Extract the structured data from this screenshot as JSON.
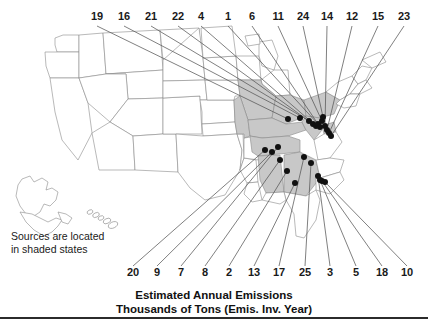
{
  "figure": {
    "title_line1": "Estimated Annual Emissions",
    "title_line2": "Thousands of Tons (Emis. Inv. Year)",
    "caption": "Sources are located\nin shaded states"
  },
  "colors": {
    "shaded_state": "#c8c8c8",
    "unshaded_state": "#ffffff",
    "state_border": "#8a8a8a",
    "leader_line": "#555555",
    "marker": "#111111",
    "text": "#1a1a1a",
    "rule": "#2b2b2b"
  },
  "map": {
    "type": "choropleth-point-callout",
    "region": "United States",
    "insets": [
      "Alaska",
      "Hawaii"
    ],
    "shaded_states": [
      "Illinois",
      "Missouri",
      "Kentucky",
      "Tennessee",
      "Alabama",
      "Georgia",
      "Ohio",
      "West Virginia",
      "Pennsylvania",
      "Maryland",
      "Indiana-partial"
    ],
    "legend_note": "Shaded states contain the emission sources"
  },
  "chart_data": {
    "type": "scatter",
    "title": "Estimated Annual Emissions",
    "subtitle": "Thousands of Tons (Emis. Inv. Year)",
    "xlabel": "",
    "ylabel": "",
    "grid": false,
    "legend": "none",
    "annotation": "Sources are located in shaded states",
    "top_labels": [
      "19",
      "16",
      "21",
      "22",
      "4",
      "1",
      "6",
      "11",
      "24",
      "14",
      "12",
      "15",
      "23"
    ],
    "bottom_labels": [
      "20",
      "9",
      "7",
      "8",
      "2",
      "13",
      "17",
      "25",
      "3",
      "5",
      "18",
      "10"
    ],
    "callouts": [
      {
        "id": "19",
        "side": "top",
        "label_x": 97,
        "label_y": 18,
        "point_x": 288,
        "point_y": 119
      },
      {
        "id": "16",
        "side": "top",
        "label_x": 124,
        "label_y": 18,
        "point_x": 300,
        "point_y": 118
      },
      {
        "id": "21",
        "side": "top",
        "label_x": 151,
        "label_y": 18,
        "point_x": 309,
        "point_y": 121
      },
      {
        "id": "22",
        "side": "top",
        "label_x": 178,
        "label_y": 18,
        "point_x": 313,
        "point_y": 124
      },
      {
        "id": "4",
        "side": "top",
        "label_x": 201,
        "label_y": 18,
        "point_x": 316,
        "point_y": 126
      },
      {
        "id": "1",
        "side": "top",
        "label_x": 228,
        "label_y": 18,
        "point_x": 318,
        "point_y": 124
      },
      {
        "id": "6",
        "side": "top",
        "label_x": 252,
        "label_y": 18,
        "point_x": 320,
        "point_y": 127
      },
      {
        "id": "11",
        "side": "top",
        "label_x": 278,
        "label_y": 18,
        "point_x": 322,
        "point_y": 121
      },
      {
        "id": "24",
        "side": "top",
        "label_x": 303,
        "label_y": 18,
        "point_x": 323,
        "point_y": 117
      },
      {
        "id": "14",
        "side": "top",
        "label_x": 327,
        "label_y": 18,
        "point_x": 325,
        "point_y": 126
      },
      {
        "id": "12",
        "side": "top",
        "label_x": 352,
        "label_y": 18,
        "point_x": 327,
        "point_y": 130
      },
      {
        "id": "15",
        "side": "top",
        "label_x": 378,
        "label_y": 18,
        "point_x": 329,
        "point_y": 133
      },
      {
        "id": "23",
        "side": "top",
        "label_x": 404,
        "label_y": 18,
        "point_x": 331,
        "point_y": 136
      },
      {
        "id": "20",
        "side": "bottom",
        "label_x": 133,
        "label_y": 274,
        "point_x": 265,
        "point_y": 150
      },
      {
        "id": "9",
        "side": "bottom",
        "label_x": 157,
        "label_y": 274,
        "point_x": 272,
        "point_y": 152
      },
      {
        "id": "7",
        "side": "bottom",
        "label_x": 181,
        "label_y": 274,
        "point_x": 278,
        "point_y": 147
      },
      {
        "id": "8",
        "side": "bottom",
        "label_x": 205,
        "label_y": 274,
        "point_x": 280,
        "point_y": 160
      },
      {
        "id": "2",
        "side": "bottom",
        "label_x": 229,
        "label_y": 274,
        "point_x": 287,
        "point_y": 171
      },
      {
        "id": "13",
        "side": "bottom",
        "label_x": 254,
        "label_y": 274,
        "point_x": 295,
        "point_y": 183
      },
      {
        "id": "17",
        "side": "bottom",
        "label_x": 279,
        "label_y": 274,
        "point_x": 304,
        "point_y": 157
      },
      {
        "id": "25",
        "side": "bottom",
        "label_x": 305,
        "label_y": 274,
        "point_x": 311,
        "point_y": 163
      },
      {
        "id": "3",
        "side": "bottom",
        "label_x": 330,
        "label_y": 274,
        "point_x": 318,
        "point_y": 176
      },
      {
        "id": "5",
        "side": "bottom",
        "label_x": 356,
        "label_y": 274,
        "point_x": 320,
        "point_y": 180
      },
      {
        "id": "18",
        "side": "bottom",
        "label_x": 382,
        "label_y": 274,
        "point_x": 322,
        "point_y": 181
      },
      {
        "id": "10",
        "side": "bottom",
        "label_x": 407,
        "label_y": 274,
        "point_x": 325,
        "point_y": 182
      }
    ]
  }
}
